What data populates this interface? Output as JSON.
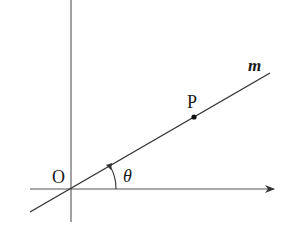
{
  "diagram": {
    "labels": {
      "origin": "O",
      "point": "P",
      "line": "m",
      "angle": "θ"
    },
    "colors": {
      "stroke": "#333333",
      "axis": "#555555",
      "text": "#1a1a1a"
    }
  }
}
